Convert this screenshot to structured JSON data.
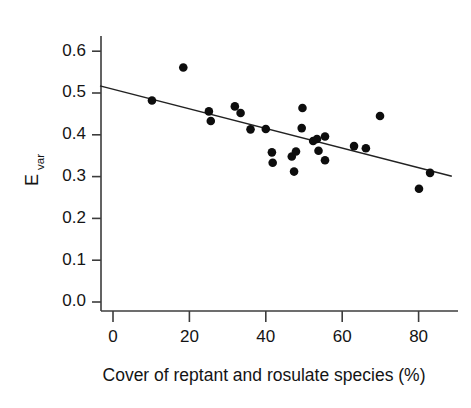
{
  "figure": {
    "kind": "scatter-with-regression-line",
    "background": "#ffffff",
    "point_color": "#0d0d0d",
    "line_color": "#222222",
    "axis_color": "#3c3c3c"
  },
  "axis_titles": {
    "y_main": "E",
    "y_sub": "var",
    "x": "Cover of reptant and rosulate species (%)"
  },
  "chart_data": {
    "type": "scatter",
    "title": "",
    "xlabel": "Cover of reptant and rosulate species (%)",
    "ylabel": "E_var",
    "xlim": [
      -4,
      88
    ],
    "ylim": [
      0.0,
      0.63
    ],
    "grid": false,
    "legend": null,
    "xticks": [
      0,
      20,
      40,
      60,
      80
    ],
    "xtick_labels": [
      "0",
      "20",
      "40",
      "60",
      "80"
    ],
    "yticks": [
      0.0,
      0.1,
      0.2,
      0.3,
      0.4,
      0.5,
      0.6
    ],
    "ytick_labels": [
      "0.0",
      "0.1",
      "0.2",
      "0.3",
      "0.4",
      "0.5",
      "0.6"
    ],
    "points": [
      {
        "x": 10.2,
        "y": 0.482
      },
      {
        "x": 18.4,
        "y": 0.561
      },
      {
        "x": 25.1,
        "y": 0.456
      },
      {
        "x": 25.6,
        "y": 0.433
      },
      {
        "x": 31.9,
        "y": 0.468
      },
      {
        "x": 33.4,
        "y": 0.452
      },
      {
        "x": 36.0,
        "y": 0.413
      },
      {
        "x": 40.0,
        "y": 0.414
      },
      {
        "x": 41.6,
        "y": 0.358
      },
      {
        "x": 41.8,
        "y": 0.333
      },
      {
        "x": 46.8,
        "y": 0.348
      },
      {
        "x": 47.4,
        "y": 0.312
      },
      {
        "x": 47.9,
        "y": 0.36
      },
      {
        "x": 49.4,
        "y": 0.416
      },
      {
        "x": 49.6,
        "y": 0.464
      },
      {
        "x": 52.4,
        "y": 0.385
      },
      {
        "x": 53.4,
        "y": 0.39
      },
      {
        "x": 53.8,
        "y": 0.362
      },
      {
        "x": 55.5,
        "y": 0.396
      },
      {
        "x": 55.5,
        "y": 0.339
      },
      {
        "x": 63.1,
        "y": 0.373
      },
      {
        "x": 66.2,
        "y": 0.368
      },
      {
        "x": 69.9,
        "y": 0.445
      },
      {
        "x": 80.1,
        "y": 0.271
      },
      {
        "x": 83.0,
        "y": 0.309
      }
    ],
    "fit_line": {
      "x_start": -3.4,
      "y_start": 0.517,
      "x_end": 88.7,
      "y_end": 0.301
    }
  }
}
